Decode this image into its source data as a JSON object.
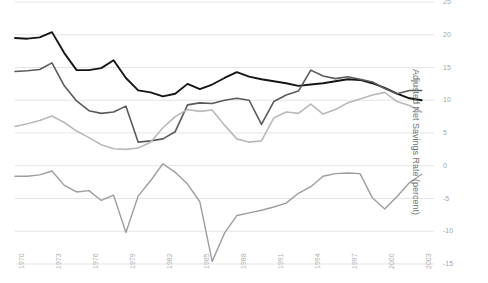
{
  "chart_data": {
    "type": "line",
    "title": "",
    "xlabel": "",
    "ylabel": "Adjusted Net Savings Rate (percent)",
    "xlim": [
      1970,
      2004
    ],
    "ylim": [
      -15,
      25
    ],
    "grid": true,
    "legend": "none",
    "y_ticks": [
      25,
      20,
      15,
      10,
      5,
      0,
      -5,
      -10,
      -15
    ],
    "y_tick_labels": [
      "25",
      "20",
      "15",
      "10",
      "5",
      "0",
      "-5",
      "-10",
      "-15"
    ],
    "x_ticks": [
      1970,
      1973,
      1976,
      1979,
      1982,
      1985,
      1988,
      1991,
      1994,
      1997,
      2000,
      2003
    ],
    "x_tick_labels": [
      "1970",
      "1973",
      "1976",
      "1979",
      "1982",
      "1985",
      "1988",
      "1991",
      "1994",
      "1997",
      "2000",
      "2003"
    ],
    "x": [
      1970,
      1971,
      1972,
      1973,
      1974,
      1975,
      1976,
      1977,
      1978,
      1979,
      1980,
      1981,
      1982,
      1983,
      1984,
      1985,
      1986,
      1987,
      1988,
      1989,
      1990,
      1991,
      1992,
      1993,
      1994,
      1995,
      1996,
      1997,
      1998,
      1999,
      2000,
      2001,
      2002,
      2003
    ],
    "series": [
      {
        "name": "series-dark",
        "color": "#151515",
        "width": 1.9,
        "values": [
          19.5,
          19.4,
          19.6,
          20.4,
          17.2,
          14.6,
          14.6,
          14.9,
          16.1,
          13.4,
          11.5,
          11.2,
          10.6,
          11.0,
          12.5,
          11.7,
          12.4,
          13.4,
          14.3,
          13.6,
          13.2,
          12.9,
          12.6,
          12.2,
          12.4,
          12.6,
          12.9,
          13.2,
          13.1,
          12.6,
          11.9,
          11.0,
          10.3,
          10.0
        ]
      },
      {
        "name": "series-mid-gray",
        "color": "#5a5a5a",
        "width": 1.6,
        "values": [
          14.4,
          14.5,
          14.7,
          15.7,
          12.2,
          9.9,
          8.4,
          8.0,
          8.2,
          9.1,
          3.6,
          3.8,
          4.1,
          5.2,
          9.3,
          9.6,
          9.5,
          10.0,
          10.3,
          10.0,
          6.3,
          9.8,
          10.8,
          11.4,
          14.6,
          13.7,
          13.3,
          13.6,
          13.2,
          12.8,
          11.8,
          11.0,
          11.5,
          11.5
        ]
      },
      {
        "name": "series-light-gray-a",
        "color": "#b9b9b9",
        "width": 1.6,
        "values": [
          6.0,
          6.4,
          6.9,
          7.6,
          6.6,
          5.3,
          4.3,
          3.2,
          2.6,
          2.5,
          2.7,
          3.6,
          5.8,
          7.5,
          8.6,
          8.3,
          8.5,
          6.2,
          4.1,
          3.6,
          3.8,
          7.3,
          8.2,
          8.0,
          9.4,
          7.9,
          8.6,
          9.6,
          10.2,
          10.8,
          11.2,
          9.8,
          9.2,
          8.2
        ]
      },
      {
        "name": "series-light-gray-b",
        "color": "#9d9d9d",
        "width": 1.4,
        "values": [
          -1.6,
          -1.6,
          -1.4,
          -0.8,
          -3.0,
          -4.0,
          -3.8,
          -5.3,
          -4.5,
          -10.2,
          -4.6,
          -2.3,
          0.3,
          -1.0,
          -2.8,
          -5.5,
          -14.6,
          -10.3,
          -7.6,
          -7.2,
          -6.8,
          -6.3,
          -5.7,
          -4.2,
          -3.2,
          -1.6,
          -1.2,
          -1.1,
          -1.2,
          -4.9,
          -6.6,
          -4.7,
          -2.6,
          -1.3
        ]
      }
    ]
  },
  "axis": {
    "y_title": "Adjusted Net Savings Rate (percent)"
  }
}
